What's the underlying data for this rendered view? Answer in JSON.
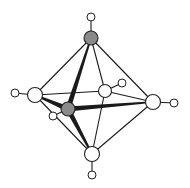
{
  "diagram": {
    "type": "molecular-structure",
    "colors": {
      "background": "#ffffff",
      "bond": "#1a1a1a",
      "open_atom_fill": "#ffffff",
      "shaded_atom_fill": "#8a8a8a",
      "outline": "#222222"
    },
    "atoms": [
      {
        "id": "top",
        "x": 91,
        "y": 38,
        "r": 7,
        "shaded": true
      },
      {
        "id": "left",
        "x": 35,
        "y": 95,
        "r": 7.5,
        "shaded": false
      },
      {
        "id": "front",
        "x": 68,
        "y": 109,
        "r": 7,
        "shaded": true
      },
      {
        "id": "back",
        "x": 105,
        "y": 91,
        "r": 6.5,
        "shaded": false
      },
      {
        "id": "right",
        "x": 153,
        "y": 102,
        "r": 7.5,
        "shaded": false
      },
      {
        "id": "bottom",
        "x": 92,
        "y": 154,
        "r": 7.5,
        "shaded": false
      }
    ],
    "terminals": [
      {
        "id": "h-top",
        "attach": "top",
        "x": 91,
        "y": 17,
        "r": 4
      },
      {
        "id": "h-left",
        "attach": "left",
        "x": 15,
        "y": 93,
        "r": 4
      },
      {
        "id": "h-front",
        "attach": "front",
        "x": 53,
        "y": 116,
        "r": 4
      },
      {
        "id": "h-back",
        "attach": "back",
        "x": 122,
        "y": 83,
        "r": 4
      },
      {
        "id": "h-right",
        "attach": "right",
        "x": 174,
        "y": 103,
        "r": 4
      },
      {
        "id": "h-bottom",
        "attach": "bottom",
        "x": 92,
        "y": 175,
        "r": 4
      }
    ],
    "bonds": [
      {
        "a": "top",
        "b": "left",
        "w": 1
      },
      {
        "a": "top",
        "b": "back",
        "w": 1
      },
      {
        "a": "top",
        "b": "right",
        "w": 1
      },
      {
        "a": "top",
        "b": "front",
        "w": 2.6
      },
      {
        "a": "bottom",
        "b": "left",
        "w": 1
      },
      {
        "a": "bottom",
        "b": "back",
        "w": 1
      },
      {
        "a": "bottom",
        "b": "right",
        "w": 1
      },
      {
        "a": "bottom",
        "b": "front",
        "w": 2.6
      },
      {
        "a": "left",
        "b": "back",
        "w": 1
      },
      {
        "a": "back",
        "b": "right",
        "w": 1
      },
      {
        "a": "left",
        "b": "front",
        "w": 2.6
      },
      {
        "a": "front",
        "b": "right",
        "w": 2.6
      }
    ]
  }
}
